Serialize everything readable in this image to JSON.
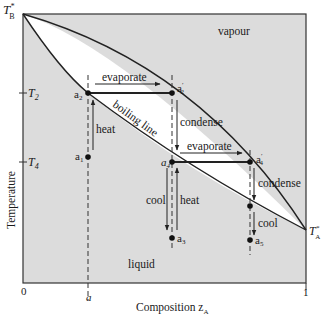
{
  "diagram": {
    "type": "phase-diagram",
    "colors": {
      "region_fill": "#dcdcdc",
      "lens_fill": "#ffffff",
      "line": "#222222",
      "background": "#ffffff"
    },
    "regions": {
      "vapour": "vapour",
      "liquid": "liquid"
    },
    "curves": {
      "boiling_line": "boiling line"
    },
    "axes": {
      "y_label": "Temperature",
      "x_label": "Composition z",
      "x_label_sub": "A",
      "x_ticks": [
        "0",
        "a",
        "1"
      ],
      "y_ticks": {
        "T2": "T",
        "T2_sub": "2",
        "T4": "T",
        "T4_sub": "4"
      },
      "endpoints": {
        "TB": "T",
        "TB_sup": "*",
        "TB_sub": "B",
        "TA": "T",
        "TA_sup": "*",
        "TA_sub": "A"
      }
    },
    "points": {
      "a1": {
        "label": "a",
        "sub": "1"
      },
      "a2": {
        "label": "a",
        "sub": "2"
      },
      "a2p": {
        "label": "a",
        "sub": "2",
        "prime": "′"
      },
      "a3": {
        "label": "a",
        "sub": "3"
      },
      "a4": {
        "label": "a",
        "sub": "4"
      },
      "a4p": {
        "label": "a",
        "sub": "4",
        "prime": "′"
      },
      "a5": {
        "label": "a",
        "sub": "5"
      }
    },
    "process_labels": {
      "evaporate_1": "evaporate",
      "evaporate_2": "evaporate",
      "condense_1": "condense",
      "condense_2": "condense",
      "heat_1": "heat",
      "heat_2": "heat",
      "cool_1": "cool",
      "cool_2": "cool"
    }
  }
}
